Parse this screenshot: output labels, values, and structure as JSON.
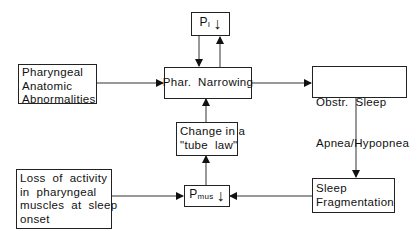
{
  "diagram": {
    "nodes": {
      "pi": {
        "symbol": "P",
        "subscript": "I",
        "arrow": "↓"
      },
      "anatomic": {
        "lines": [
          "Pharyngeal",
          "Anatomic",
          "Abnormalities"
        ]
      },
      "narrowing": {
        "label": "Phar.  Narrowing"
      },
      "osa": {
        "lines": [
          "Obstr.  Sleep",
          "Apnea/Hypopnea"
        ]
      },
      "tube_law": {
        "lines": [
          "Change in a",
          "\"tube  law\""
        ]
      },
      "loss": {
        "lines": [
          "Loss  of  activity",
          "in  pharyngeal",
          "muscles  at  sleep",
          "onset"
        ]
      },
      "pmus": {
        "symbol": "P",
        "subscript": "mus",
        "arrow": "↓"
      },
      "fragmentation": {
        "lines": [
          "Sleep",
          "Fragmentation"
        ]
      }
    },
    "edges": [
      {
        "from": "anatomic",
        "to": "narrowing"
      },
      {
        "from": "pi",
        "to": "narrowing"
      },
      {
        "from": "narrowing",
        "to": "pi"
      },
      {
        "from": "tube_law",
        "to": "narrowing"
      },
      {
        "from": "narrowing",
        "to": "osa"
      },
      {
        "from": "osa",
        "to": "fragmentation"
      },
      {
        "from": "fragmentation",
        "to": "pmus"
      },
      {
        "from": "loss",
        "to": "pmus"
      },
      {
        "from": "pmus",
        "to": "tube_law"
      }
    ]
  }
}
